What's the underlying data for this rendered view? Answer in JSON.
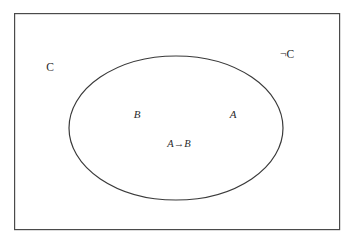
{
  "figure": {
    "background_color": "#ffffff",
    "stroke_color": "#3a3a3a",
    "text_color": "#2b2b2b"
  },
  "outer_box": {
    "name": "universe-rectangle",
    "x": 14,
    "y": 13,
    "width": 326,
    "height": 217,
    "stroke_color": "#4a4a4a",
    "stroke_width": 1.2,
    "fill": "none"
  },
  "ellipse": {
    "name": "context-ellipse",
    "cx": 176,
    "cy": 128,
    "rx": 107,
    "ry": 72,
    "stroke_color": "#3a3a3a",
    "stroke_width": 1.2,
    "fill": "none"
  },
  "labels": [
    {
      "id": "label-c",
      "text": "C",
      "x": 50,
      "y": 68,
      "kind": "universe",
      "region": "outside-ellipse-left"
    },
    {
      "id": "label-not-c",
      "text": "¬C",
      "x": 287,
      "y": 55,
      "kind": "universe",
      "region": "outside-ellipse-right"
    },
    {
      "id": "label-b",
      "text": "B",
      "x": 137,
      "y": 114,
      "kind": "set",
      "region": "inside-ellipse-left"
    },
    {
      "id": "label-a",
      "text": "A",
      "x": 233,
      "y": 114,
      "kind": "set",
      "region": "inside-ellipse-right"
    },
    {
      "id": "label-a-implies-b",
      "text": "A→B",
      "x": 179,
      "y": 144,
      "kind": "implication",
      "region": "inside-ellipse-center"
    }
  ],
  "caption_sliver": {
    "text": "",
    "visible": false
  }
}
